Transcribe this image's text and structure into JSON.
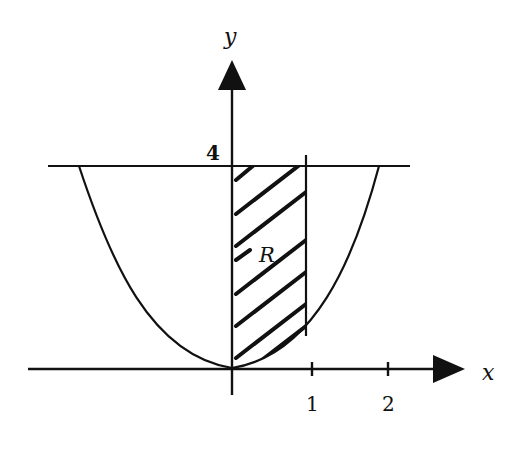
{
  "figure": {
    "axes": {
      "x_label": "x",
      "y_label": "y",
      "x_ticks": [
        "1",
        "2"
      ],
      "y_ticks": [
        "4"
      ]
    },
    "region_label": "R",
    "curve": "parabola symmetric about y-axis, vertex at origin",
    "horizontal_line": "y = 4",
    "vertical_line": "x = 1",
    "shaded_region": "between y-axis and x = 1, above curve, below y = 4",
    "colors": {
      "ink": "#111111",
      "background": "#ffffff"
    }
  }
}
